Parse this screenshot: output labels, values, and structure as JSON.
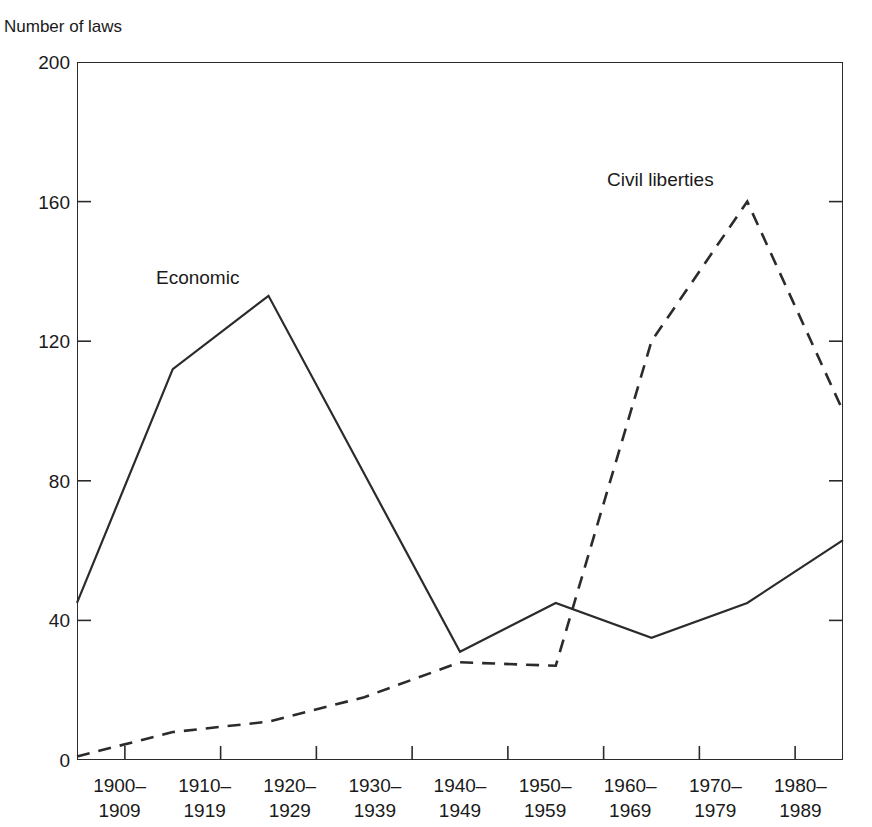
{
  "page": {
    "clipped_header_text": "",
    "background": "#ffffff",
    "ink": "#1a1a1a"
  },
  "axis": {
    "y_title": "Number of laws",
    "y_ticks": [
      "0",
      "40",
      "80",
      "120",
      "160",
      "200"
    ],
    "x_tick_labels": [
      {
        "line1": "1900–",
        "line2": "1909"
      },
      {
        "line1": "1910–",
        "line2": "1919"
      },
      {
        "line1": "1920–",
        "line2": "1929"
      },
      {
        "line1": "1930–",
        "line2": "1939"
      },
      {
        "line1": "1940–",
        "line2": "1949"
      },
      {
        "line1": "1950–",
        "line2": "1959"
      },
      {
        "line1": "1960–",
        "line2": "1969"
      },
      {
        "line1": "1970–",
        "line2": "1979"
      },
      {
        "line1": "1980–",
        "line2": "1989"
      }
    ]
  },
  "series_labels": {
    "economic": "Economic",
    "civil_liberties": "Civil liberties"
  },
  "chart_data": {
    "type": "line",
    "title": "",
    "xlabel": "",
    "ylabel": "Number of laws",
    "ylim": [
      0,
      200
    ],
    "ytick_values": [
      0,
      40,
      80,
      120,
      160,
      200
    ],
    "grid": false,
    "legend": "inline-annotations",
    "categories": [
      "1900–1909",
      "1910–1919",
      "1920–1929",
      "1930–1939",
      "1940–1949",
      "1950–1959",
      "1960–1969",
      "1970–1979",
      "1980–1989"
    ],
    "series": [
      {
        "name": "Economic",
        "style": "solid",
        "color": "#2b2b2b",
        "values": [
          45,
          112,
          133,
          82,
          31,
          45,
          35,
          45,
          63
        ]
      },
      {
        "name": "Civil liberties",
        "style": "dashed",
        "color": "#2b2b2b",
        "values": [
          1,
          8,
          11,
          18,
          28,
          27,
          120,
          160,
          100
        ]
      }
    ]
  }
}
